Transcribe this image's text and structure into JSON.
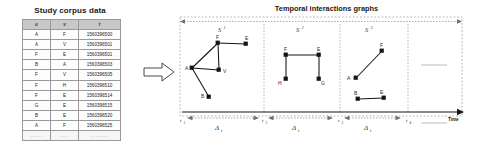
{
  "left_panel": {
    "title": "Study corpus data",
    "table": {
      "columns": [
        "u",
        "v",
        "t"
      ],
      "rows": [
        [
          "A",
          "F",
          "1560396500"
        ],
        [
          "A",
          "V",
          "1560396501"
        ],
        [
          "F",
          "E",
          "1560396501"
        ],
        [
          "B",
          "A",
          "1560396503"
        ],
        [
          "F",
          "V",
          "1560396505"
        ],
        [
          "F",
          "H",
          "1560396510"
        ],
        [
          "F",
          "E",
          "1560396514"
        ],
        [
          "G",
          "E",
          "1560396515"
        ],
        [
          "B",
          "E",
          "1560396520"
        ],
        [
          "A",
          "F",
          "1560396525"
        ]
      ],
      "ellipsis_row": [
        "......",
        "......",
        ".........."
      ]
    }
  },
  "flow": {
    "arrow_icon": "right-block-arrow"
  },
  "right_panel": {
    "title": "Temporal interactions graphs",
    "time_axis_label": "Time",
    "tick_labels": [
      {
        "base": "t",
        "sub": "1"
      },
      {
        "base": "t",
        "sub": "2"
      },
      {
        "base": "t",
        "sub": "3"
      },
      {
        "base": "t",
        "sub": "4"
      }
    ],
    "interval_label": {
      "base": "Δ",
      "sub": "t"
    },
    "snapshot_labels": [
      {
        "base": "S",
        "sup": "1"
      },
      {
        "base": "S",
        "sup": "2"
      },
      {
        "base": "S",
        "sup": "3"
      }
    ],
    "graphs": [
      {
        "name": "S1",
        "nodes": [
          {
            "id": "A",
            "label": "A",
            "x": 16,
            "y": 68,
            "label_dx": -7,
            "label_dy": 1
          },
          {
            "id": "F",
            "label": "F",
            "x": 42,
            "y": 43,
            "label_dx": -2,
            "label_dy": -4
          },
          {
            "id": "E",
            "label": "E",
            "x": 70,
            "y": 44,
            "label_dx": -1,
            "label_dy": -4
          },
          {
            "id": "V",
            "label": "V",
            "x": 43,
            "y": 70,
            "label_dx": 4,
            "label_dy": 3
          },
          {
            "id": "B",
            "label": "B",
            "x": 33,
            "y": 97,
            "label_dx": -7,
            "label_dy": 1
          }
        ],
        "edges": [
          [
            "A",
            "F"
          ],
          [
            "F",
            "E"
          ],
          [
            "F",
            "V"
          ],
          [
            "A",
            "V"
          ],
          [
            "A",
            "B"
          ]
        ]
      },
      {
        "name": "S2",
        "nodes": [
          {
            "id": "F",
            "label": "F",
            "x": 110,
            "y": 55,
            "label_dx": -2,
            "label_dy": -4
          },
          {
            "id": "E",
            "label": "E",
            "x": 143,
            "y": 55,
            "label_dx": -2,
            "label_dy": -4
          },
          {
            "id": "H",
            "label": "H",
            "x": 110,
            "y": 79,
            "label_dx": -7,
            "label_dy": 5
          },
          {
            "id": "G",
            "label": "G",
            "x": 143,
            "y": 79,
            "label_dx": 3,
            "label_dy": 5
          }
        ],
        "edges": [
          [
            "F",
            "E"
          ],
          [
            "F",
            "H"
          ],
          [
            "E",
            "G"
          ]
        ]
      },
      {
        "name": "S3",
        "nodes": [
          {
            "id": "A",
            "label": "A",
            "x": 180,
            "y": 78,
            "label_dx": -7,
            "label_dy": -1
          },
          {
            "id": "F",
            "label": "F",
            "x": 206,
            "y": 51,
            "label_dx": -2,
            "label_dy": -4
          },
          {
            "id": "B",
            "label": "B",
            "x": 182,
            "y": 99,
            "label_dx": -2,
            "label_dy": -4
          },
          {
            "id": "E",
            "label": "E",
            "x": 208,
            "y": 98,
            "label_dx": -2,
            "label_dy": -5
          }
        ],
        "edges": [
          [
            "A",
            "F"
          ],
          [
            "B",
            "E"
          ]
        ]
      }
    ]
  },
  "colors": {
    "node": "#141414",
    "edge": "#141414",
    "dashed_guide": "#9a9a9a",
    "axis": "#141414",
    "table_header_bg": "#c8c8c8"
  }
}
